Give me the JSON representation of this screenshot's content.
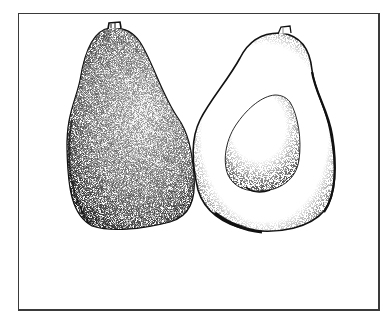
{
  "image": {
    "subject": "avocado illustration",
    "style": "black-and-white stipple drawing",
    "elements": [
      {
        "name": "whole-avocado",
        "description": "whole pear-shaped avocado with stippled textured skin"
      },
      {
        "name": "halved-avocado",
        "description": "avocado cut in half showing flesh and pit cavity with seed"
      }
    ],
    "colors": {
      "ink": "#111111",
      "paper": "#ffffff",
      "frame": "#3a3a3a"
    }
  }
}
